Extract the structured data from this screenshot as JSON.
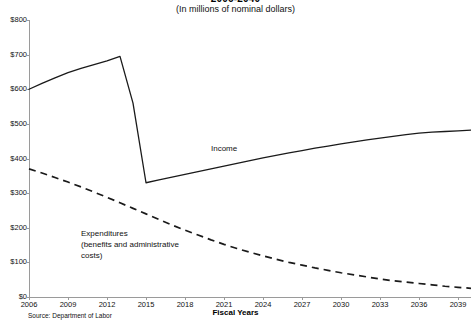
{
  "header": {
    "title": "2006-2040",
    "subtitle": "(In millions of nominal dollars)"
  },
  "footer": {
    "source": "Source: Department of Labor"
  },
  "annotations": {
    "income_label": "Income",
    "expenditures_label_line1": "Expenditures",
    "expenditures_label_line2": "(benefits and administrative",
    "expenditures_label_line3": "costs)"
  },
  "chart_data": {
    "type": "line",
    "title": "2006-2040",
    "subtitle": "(In millions of nominal dollars)",
    "xlabel": "Fiscal Years",
    "ylabel": "",
    "xlim": [
      2006,
      2040
    ],
    "ylim": [
      0,
      800
    ],
    "grid": false,
    "legend_position": "inline-annotations",
    "y_tick_labels": [
      "$0",
      "$100",
      "$200",
      "$300",
      "$400",
      "$500",
      "$600",
      "$700",
      "$800"
    ],
    "y_tick_values": [
      0,
      100,
      200,
      300,
      400,
      500,
      600,
      700,
      800
    ],
    "x_tick_labels": [
      "2006",
      "2009",
      "2012",
      "2015",
      "2018",
      "2021",
      "2024",
      "2027",
      "2030",
      "2033",
      "2036",
      "2039"
    ],
    "x_tick_values": [
      2006,
      2009,
      2012,
      2015,
      2018,
      2021,
      2024,
      2027,
      2030,
      2033,
      2036,
      2039
    ],
    "series": [
      {
        "name": "Income",
        "style": "solid",
        "color": "#1a1a1a",
        "x": [
          2006,
          2007,
          2008,
          2009,
          2010,
          2011,
          2012,
          2013,
          2014,
          2015,
          2016,
          2017,
          2018,
          2019,
          2020,
          2021,
          2022,
          2023,
          2024,
          2025,
          2026,
          2027,
          2028,
          2029,
          2030,
          2031,
          2032,
          2033,
          2034,
          2035,
          2036,
          2037,
          2038,
          2039,
          2040
        ],
        "values": [
          600,
          617,
          633,
          648,
          660,
          671,
          682,
          695,
          560,
          330,
          338,
          346,
          354,
          362,
          370,
          378,
          386,
          394,
          402,
          409,
          416,
          423,
          430,
          436,
          442,
          448,
          454,
          459,
          464,
          469,
          473,
          476,
          478,
          480,
          482
        ]
      },
      {
        "name": "Expenditures (benefits and administrative costs)",
        "style": "dashed",
        "color": "#1a1a1a",
        "x": [
          2006,
          2007,
          2008,
          2009,
          2010,
          2011,
          2012,
          2013,
          2014,
          2015,
          2016,
          2017,
          2018,
          2019,
          2020,
          2021,
          2022,
          2023,
          2024,
          2025,
          2026,
          2027,
          2028,
          2029,
          2030,
          2031,
          2032,
          2033,
          2034,
          2035,
          2036,
          2037,
          2038,
          2039,
          2040
        ],
        "values": [
          370,
          358,
          345,
          332,
          318,
          303,
          288,
          272,
          256,
          240,
          224,
          208,
          193,
          179,
          165,
          152,
          140,
          129,
          119,
          109,
          100,
          92,
          84,
          77,
          70,
          64,
          58,
          52,
          47,
          43,
          39,
          35,
          31,
          28,
          25
        ]
      }
    ]
  }
}
